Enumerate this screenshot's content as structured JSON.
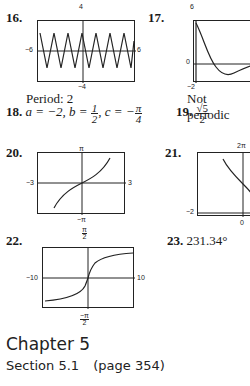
{
  "problems": {
    "p16": {
      "number": "16.",
      "graph": {
        "ymax": "4",
        "ymin": "−4",
        "xmin": "−6",
        "xmax": "6"
      },
      "caption": "Period: 2"
    },
    "p17": {
      "number": "17.",
      "graph": {
        "ymax": "6",
        "ymin": "−2",
        "xmin": "0"
      },
      "caption": "Not periodic"
    },
    "p18": {
      "number": "18.",
      "a_text": "a = −2, b = ",
      "b_num": "1",
      "b_den": "2",
      "c_text": ", c = −",
      "c_num": "π",
      "c_den": "4"
    },
    "p19": {
      "number": "19.",
      "num": "√5",
      "den": "2"
    },
    "p20": {
      "number": "20.",
      "graph": {
        "ymax": "π",
        "ymin": "−π",
        "xmin": "−3",
        "xmax": "3"
      }
    },
    "p21": {
      "number": "21.",
      "graph": {
        "ymax": "2π",
        "xmin": "−2",
        "xorigin": "0"
      }
    },
    "p22": {
      "number": "22.",
      "graph": {
        "ymax_num": "π",
        "ymax_den": "2",
        "ymin_num": "−π",
        "ymin_den": "2",
        "xmin": "−10",
        "xmax": "10"
      }
    },
    "p23": {
      "number": "23.",
      "answer": "231.34°"
    }
  },
  "chapter": {
    "title": "Chapter 5"
  },
  "section": {
    "label": "Section 5.1",
    "page": "(page 354)"
  }
}
